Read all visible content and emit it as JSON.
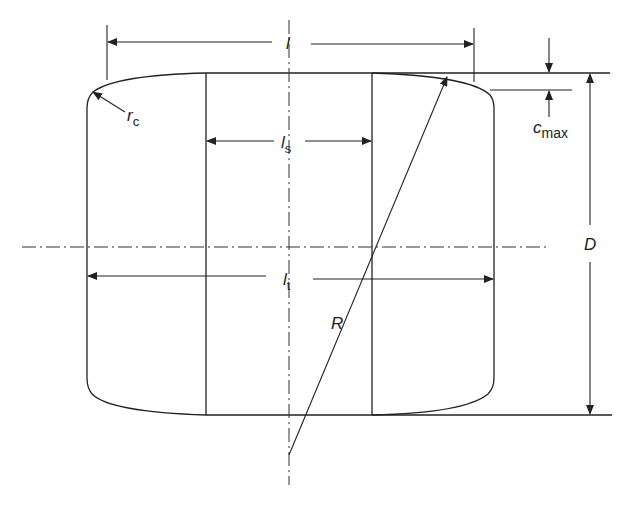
{
  "diagram": {
    "colors": {
      "line": "#222222",
      "background": "#ffffff"
    },
    "labels": {
      "l": {
        "main": "l",
        "sub": ""
      },
      "ls": {
        "main": "l",
        "sub": "s"
      },
      "lt": {
        "main": "l",
        "sub": "t"
      },
      "rc": {
        "main": "r",
        "sub": "c"
      },
      "cmax": {
        "main": "c",
        "sub": "max"
      },
      "D": {
        "main": "D",
        "sub": ""
      },
      "R": {
        "main": "R",
        "sub": ""
      }
    },
    "dimensions": [
      {
        "name": "l",
        "meaning": "overall roller length"
      },
      {
        "name": "ls",
        "meaning": "straight (cylindrical) length"
      },
      {
        "name": "lt",
        "meaning": "total effective length"
      },
      {
        "name": "D",
        "meaning": "roller diameter"
      },
      {
        "name": "R",
        "meaning": "crown radius"
      },
      {
        "name": "rc",
        "meaning": "corner radius"
      },
      {
        "name": "cmax",
        "meaning": "maximum crown drop"
      }
    ]
  }
}
